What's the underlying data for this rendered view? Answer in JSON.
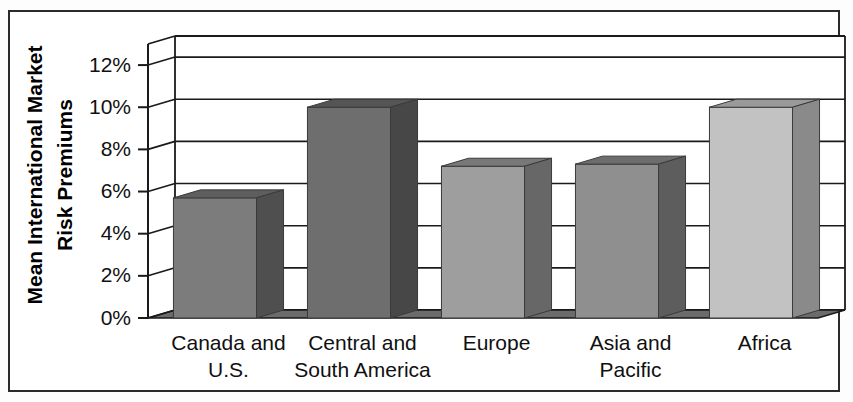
{
  "chart_data": {
    "type": "bar",
    "title": "",
    "subtitle": "",
    "xlabel": "",
    "ylabel": "Mean International Market Risk Premiums",
    "ylabel_lines": [
      "Mean International Market",
      "Risk Premiums"
    ],
    "categories": [
      "Canada and U.S.",
      "Central and South America",
      "Europe",
      "Asia and Pacific",
      "Africa"
    ],
    "category_lines": [
      [
        "Canada and",
        "U.S."
      ],
      [
        "Central and",
        "South America"
      ],
      [
        "Europe",
        ""
      ],
      [
        "Asia and",
        "Pacific"
      ],
      [
        "Africa",
        ""
      ]
    ],
    "values": [
      5.7,
      10.0,
      7.2,
      7.3,
      10.0
    ],
    "value_labels": [
      "5.7%",
      "10.0%",
      "7.2%",
      "7.3%",
      "10.0%"
    ],
    "ylim": [
      0,
      13
    ],
    "ytick_values": [
      0,
      2,
      4,
      6,
      8,
      10,
      12
    ],
    "ytick_labels": [
      "0%",
      "2%",
      "4%",
      "6%",
      "8%",
      "10%",
      "12%"
    ],
    "grid": true,
    "grid_axis": "y",
    "legend": false,
    "legend_position": "none",
    "three_d": true,
    "bar_colors": [
      "#7c7c7c",
      "#6e6e6e",
      "#9e9e9e",
      "#8f8f8f",
      "#c2c2c2"
    ],
    "bar_top_colors": [
      "#5e5e5e",
      "#555555",
      "#787878",
      "#6d6d6d",
      "#9a9a9a"
    ],
    "bar_side_colors": [
      "#4f4f4f",
      "#474747",
      "#676767",
      "#5d5d5d",
      "#8a8a8a"
    ],
    "floor_color": "#6b6b6b",
    "wall_color": "#ffffff",
    "axis_color": "#1a1a1a",
    "border_color": "#2b2b2b"
  }
}
